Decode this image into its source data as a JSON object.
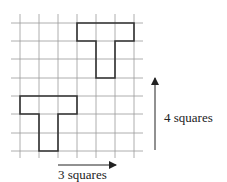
{
  "diagram": {
    "type": "translation-on-grid",
    "grid": {
      "columns": 7,
      "rows": 7,
      "x_lines": [
        20,
        39,
        58,
        77,
        96,
        115,
        134
      ],
      "y_lines": [
        23,
        41,
        59,
        78,
        96,
        114,
        133,
        151
      ],
      "line_color": "#9a9a9a"
    },
    "shapes": [
      {
        "name": "original-T",
        "description": "T-shape, 3 squares across top, 2 squares stem",
        "points": "20,96 77,96 77,114 58,114 58,151 39,151 39,114 20,114"
      },
      {
        "name": "translated-T",
        "description": "T-shape after translation 3 right, 4 up",
        "points": "77,23 134,23 134,41 115,41 115,78 96,78 96,41 77,41"
      }
    ],
    "shape_color": "#333333",
    "arrows": {
      "horizontal": {
        "label": "3 squares",
        "x1": 58,
        "y1": 165,
        "x2": 116,
        "y2": 165
      },
      "vertical": {
        "label": "4 squares",
        "x1": 155,
        "y1": 150,
        "x2": 155,
        "y2": 78
      }
    },
    "arrow_color": "#222222"
  }
}
